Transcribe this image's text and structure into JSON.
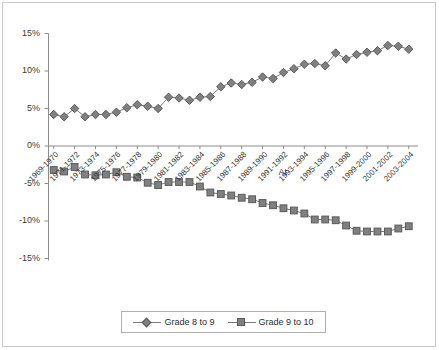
{
  "chart_data": {
    "type": "line",
    "title": "",
    "subtitle": "",
    "xlabel": "",
    "ylabel": "",
    "ylim": [
      -15,
      15
    ],
    "ytick_labels": [
      "15%",
      "10%",
      "5%",
      "0%",
      "-5%",
      "-10%",
      "-15%"
    ],
    "ytick_values": [
      15,
      10,
      5,
      0,
      -5,
      -10,
      -15
    ],
    "grid": false,
    "legend_position": "bottom-center",
    "categories": [
      "1969-1970",
      "1970-1971",
      "1971-1972",
      "1972-1973",
      "1973-1974",
      "1974-1975",
      "1975-1976",
      "1976-1977",
      "1977-1978",
      "1978-1979",
      "1979-1980",
      "1980-1981",
      "1981-1982",
      "1982-1983",
      "1983-1984",
      "1984-1985",
      "1985-1986",
      "1986-1987",
      "1987-1988",
      "1988-1989",
      "1989-1990",
      "1990-1991",
      "1991-1992",
      "1992-1993",
      "1993-1994",
      "1994-1995",
      "1995-1996",
      "1996-1997",
      "1997-1998",
      "1998-1999",
      "1999-2000",
      "2000-2001",
      "2001-2002",
      "2002-2003",
      "2003-2004"
    ],
    "xtick_labels_shown": [
      "1969-1970",
      "1971-1972",
      "1973-1974",
      "1975-1976",
      "1977-1978",
      "1979-1980",
      "1981-1982",
      "1983-1984",
      "1985-1986",
      "1987-1988",
      "1989-1990",
      "1991-1992",
      "1993-1994",
      "1995-1996",
      "1997-1998",
      "1999-2000",
      "2001-2002",
      "2003-2004"
    ],
    "series": [
      {
        "name": "Grade 8 to 9",
        "marker": "diamond",
        "color": "#808080",
        "values": [
          4.2,
          3.9,
          5.0,
          3.9,
          4.2,
          4.2,
          4.5,
          5.1,
          5.5,
          5.3,
          5.0,
          6.5,
          6.4,
          6.1,
          6.5,
          6.6,
          7.9,
          8.4,
          8.2,
          8.5,
          9.2,
          9.0,
          9.8,
          10.3,
          10.9,
          11.0,
          10.7,
          12.4,
          11.6,
          12.2,
          12.5,
          12.7,
          13.4,
          13.3,
          12.9
        ]
      },
      {
        "name": "Grade 9 to 10",
        "marker": "square",
        "color": "#808080",
        "values": [
          -3.2,
          -3.4,
          -2.8,
          -3.8,
          -3.9,
          -3.8,
          -3.5,
          -4.1,
          -4.2,
          -4.9,
          -5.2,
          -4.8,
          -4.8,
          -4.8,
          -5.4,
          -6.2,
          -6.4,
          -6.6,
          -6.9,
          -7.1,
          -7.6,
          -7.9,
          -8.3,
          -8.6,
          -9.0,
          -9.8,
          -9.8,
          -9.9,
          -10.6,
          -11.3,
          -11.4,
          -11.4,
          -11.4,
          -11.0,
          -10.7
        ]
      }
    ],
    "annotations": [
      {
        "text": "At",
        "x_index": 22,
        "y_value": -3.6
      }
    ]
  },
  "legend": {
    "entries": [
      {
        "label": "Grade 8 to 9",
        "marker": "diamond"
      },
      {
        "label": "Grade 9 to 10",
        "marker": "square"
      }
    ]
  },
  "colors": {
    "series_fill": "#808080",
    "series_stroke": "#5a5a5a",
    "line": "#7b7b7b",
    "axis": "#8c8c8c",
    "text": "#3a3a3a",
    "frame": "#c8c8c8"
  }
}
